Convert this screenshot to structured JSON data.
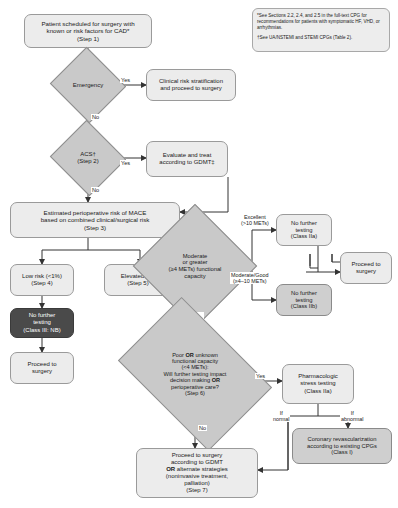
{
  "diagram": {
    "nodes": {
      "start": "Patient scheduled for surgery with known or risk factors for CAD*\n(Step 1)",
      "note": "*See Sections 2.2, 2.4, and 2.5 in the full-text CPG for recommendations for patients with symptomatic HF, VHD, or arrhythmias.\n\n†See UA/NSTEMI and STEMI CPGs (Table 2).",
      "note_line1": "*See Sections 2.2, 2.4, and 2.5 in the full-text CPG for recommendations for patients with symptomatic HF, VHD, or arrhythmias.",
      "note_line2": "†See UA/NSTEMI and STEMI CPGs (Table 2).",
      "emergency": "Emergency",
      "clinical_risk": "Clinical risk stratification and proceed to surgery",
      "acs": "ACS†\n(Step 2)",
      "gdmt": "Evaluate and treat according to GDMT‡",
      "mace": "Estimated perioperative risk of MACE based on combined clinical/surgical risk\n(Step 3)",
      "low_risk": "Low risk (<1%)\n(Step 4)",
      "elevated_risk": "Elevated risk\n(Step 5)",
      "no_further_nb": "No further testing\n(Class III: NB)",
      "proceed_left": "Proceed to surgery",
      "mets_diamond": "Moderate or greater (≥4 METs) functional capacity",
      "no_further_iia": "No further testing\n(Class IIa)",
      "no_further_iib": "No further testing\n(Class IIb)",
      "proceed_right": "Proceed to surgery",
      "poor_diamond": "Poor OR unknown functional capacity (<4 METs): Will further testing impact decision making OR perioperative care?\n(Step 6)",
      "stress_test": "Pharmacologic stress testing\n(Class IIa)",
      "revasc": "Coronary revascularization according to existing CPGs\n(Class I)",
      "final": "Proceed to surgery according to GDMT OR alternate strategies (noninvasive treatment, palliation)\n(Step 7)"
    },
    "node_text": {
      "start_l1": "Patient scheduled for surgery with",
      "start_l2": "known or risk factors for CAD*",
      "start_l3": "(Step 1)",
      "clinical_l1": "Clinical risk stratification",
      "clinical_l2": "and proceed to surgery",
      "acs_l1": "ACS†",
      "acs_l2": "(Step 2)",
      "gdmt_l1": "Evaluate and treat",
      "gdmt_l2": "according to GDMT‡",
      "mace_l1": "Estimated perioperative risk of MACE",
      "mace_l2": "based on combined clinical/surgical risk",
      "mace_l3": "(Step 3)",
      "low_l1": "Low risk (<1%)",
      "low_l2": "(Step 4)",
      "elev_l1": "Elevated risk",
      "elev_l2": "(Step 5)",
      "nb_l1": "No further",
      "nb_l2": "testing",
      "nb_l3": "(Class III: NB)",
      "proceed_l1": "Proceed to",
      "proceed_l2": "surgery",
      "mets_l1": "Moderate",
      "mets_l2": "or greater",
      "mets_l3": "(≥4 METs) functional",
      "mets_l4": "capacity",
      "iia_l1": "No further",
      "iia_l2": "testing",
      "iia_l3": "(Class IIa)",
      "iib_l1": "No further",
      "iib_l2": "testing",
      "iib_l3": "(Class IIb)",
      "pr_l1": "Proceed to",
      "pr_l2": "surgery",
      "poor_l1a": "Poor ",
      "poor_l1b": "OR",
      "poor_l1c": " unknown",
      "poor_l2": "functional capacity",
      "poor_l3": "(<4 METs):",
      "poor_l4": "Will further testing impact",
      "poor_l5a": "decision making ",
      "poor_l5b": "OR",
      "poor_l6": "perioperative care?",
      "poor_l7": "(Step 6)",
      "stress_l1": "Pharmacologic",
      "stress_l2": "stress testing",
      "stress_l3": "(Class IIa)",
      "revasc_l1": "Coronary revascularization",
      "revasc_l2": "according to existing CPGs",
      "revasc_l3": "(Class I)",
      "final_l1": "Proceed to surgery",
      "final_l2": "according to GDMT",
      "final_l3a": "OR",
      "final_l3b": " alternate strategies",
      "final_l4": "(noninvasive treatment,",
      "final_l5": "palliation)",
      "final_l6": "(Step 7)"
    },
    "edge_labels": {
      "emergency_yes": "Yes",
      "emergency_no": "No",
      "acs_yes": "Yes",
      "acs_no": "No",
      "excellent_l1": "Excellent",
      "excellent_l2": "(>10 METs)",
      "moderate_good_l1": "Moderate/Good",
      "moderate_good_l2": "(≥4–10 METs)",
      "no_or_unknown_l1": "No or",
      "no_or_unknown_l2": "unknown",
      "poor_yes": "Yes",
      "poor_no": "No",
      "if_normal_l1": "If",
      "if_normal_l2": "normal",
      "if_abnormal_l1": "If",
      "if_abnormal_l2": "abnormal"
    },
    "colors": {
      "box_light": "#ececec",
      "box_mid": "#cfcfcf",
      "box_dark": "#4a4a4a",
      "diamond": "#c9c9c9",
      "stroke": "#6f6f6f",
      "text": "#1a1a1a"
    }
  }
}
